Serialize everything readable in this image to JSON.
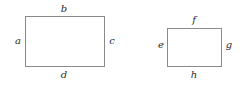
{
  "canvas": {
    "width": 252,
    "height": 88,
    "background": "#ffffff",
    "stroke_color": "#8a8a8a",
    "label_color": "#2b2b2b"
  },
  "diagram": {
    "type": "geometry-rectangles",
    "figures": [
      {
        "name": "left-rectangle",
        "labels": {
          "left": "a",
          "top": "b",
          "right": "c",
          "bottom": "d"
        }
      },
      {
        "name": "right-rectangle",
        "labels": {
          "left": "e",
          "top": "f",
          "right": "g",
          "bottom": "h"
        }
      }
    ]
  }
}
